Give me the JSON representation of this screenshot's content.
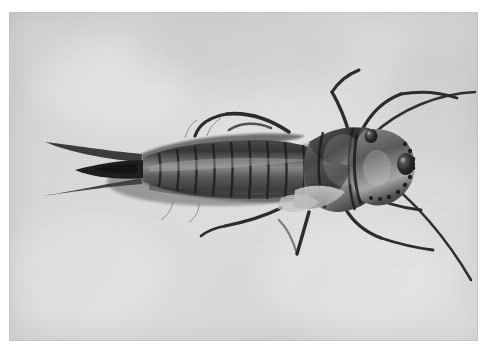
{
  "page": {
    "background_color": "#ffffff",
    "caption": ""
  },
  "photo": {
    "name": "insect-nymph-photograph",
    "medium": "black-and-white photograph",
    "background_color": "#dcdcdc",
    "border_color": "#ffffff",
    "x": 9,
    "y": 12,
    "width": 469,
    "height": 329,
    "alt_text": "Dorsal view of an aquatic insect nymph (stonefly larva) on a plain pale grey background, head facing right",
    "subject": {
      "common_name": "aquatic insect nymph",
      "orientation": "dorsal view, head to the right, tail to the left",
      "body_color_dark": "#2b2b2b",
      "body_color_mid": "#6e6e6e",
      "body_color_light": "#b9b9b9",
      "parts": [
        {
          "name": "cerci",
          "count": 3,
          "note": "two slender pale outer tails and one thick dark median tail, pointing left"
        },
        {
          "name": "abdomen",
          "segments": 9,
          "note": "banded segments with fringed gill hairs along both margins"
        },
        {
          "name": "thorax",
          "note": "three segments with dark wing pads"
        },
        {
          "name": "head",
          "note": "rounded capsule with two dark compound eyes and a granulate margin"
        },
        {
          "name": "antennae",
          "count": 2,
          "note": "long, thin, curving to the right"
        },
        {
          "name": "legs",
          "count": 6,
          "note": "three pairs, splayed forward, upward and downward"
        }
      ]
    }
  }
}
